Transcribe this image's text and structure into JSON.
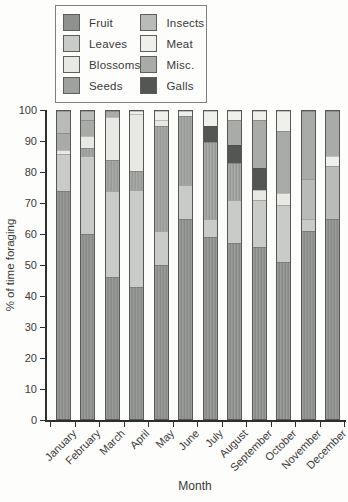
{
  "figure": {
    "y_axis_label": "% of time foraging",
    "x_axis_title": "Month",
    "y_ticks": [
      0,
      10,
      20,
      30,
      40,
      50,
      60,
      70,
      80,
      90,
      100
    ]
  },
  "legend": {
    "entries": [
      {
        "label": "Fruit",
        "color": "#8f918e"
      },
      {
        "label": "Leaves",
        "color": "#c9cbc8"
      },
      {
        "label": "Blossoms",
        "color": "#e8e9e5"
      },
      {
        "label": "Seeds",
        "color": "#9fa19e"
      },
      {
        "label": "Insects",
        "color": "#b9bbb8"
      },
      {
        "label": "Meat",
        "color": "#eff0ec"
      },
      {
        "label": "Misc.",
        "color": "#a9aba8"
      },
      {
        "label": "Galls",
        "color": "#545653"
      }
    ]
  },
  "chart_data": {
    "type": "bar",
    "stacked": true,
    "title": "",
    "xlabel": "Month",
    "ylabel": "% of time foraging",
    "ylim": [
      0,
      100
    ],
    "grid": false,
    "legend_position": "top-left",
    "series_names": [
      "Fruit",
      "Leaves",
      "Blossoms",
      "Seeds",
      "Insects",
      "Meat",
      "Misc.",
      "Galls"
    ],
    "categories": [
      "January",
      "February",
      "March",
      "April",
      "May",
      "June",
      "July",
      "August",
      "September",
      "October",
      "November",
      "December"
    ],
    "months": [
      {
        "month": "January",
        "segments": [
          {
            "category": "Fruit",
            "value": 74
          },
          {
            "category": "Leaves",
            "value": 12
          },
          {
            "category": "Blossoms",
            "value": 1.5
          },
          {
            "category": "Misc.",
            "value": 5.5
          },
          {
            "category": "Insects",
            "value": 7
          }
        ]
      },
      {
        "month": "February",
        "segments": [
          {
            "category": "Fruit",
            "value": 60
          },
          {
            "category": "Leaves",
            "value": 25.5
          },
          {
            "category": "Seeds",
            "value": 2.5
          },
          {
            "category": "Blossoms",
            "value": 4
          },
          {
            "category": "Misc.",
            "value": 5
          },
          {
            "category": "Insects",
            "value": 3
          }
        ]
      },
      {
        "month": "March",
        "segments": [
          {
            "category": "Fruit",
            "value": 46
          },
          {
            "category": "Leaves",
            "value": 28
          },
          {
            "category": "Seeds",
            "value": 10
          },
          {
            "category": "Blossoms",
            "value": 14
          },
          {
            "category": "Misc.",
            "value": 2
          }
        ]
      },
      {
        "month": "April",
        "segments": [
          {
            "category": "Fruit",
            "value": 43
          },
          {
            "category": "Leaves",
            "value": 31.5
          },
          {
            "category": "Seeds",
            "value": 6
          },
          {
            "category": "Blossoms",
            "value": 18.5
          },
          {
            "category": "Meat",
            "value": 1
          }
        ]
      },
      {
        "month": "May",
        "segments": [
          {
            "category": "Fruit",
            "value": 50
          },
          {
            "category": "Leaves",
            "value": 11
          },
          {
            "category": "Seeds",
            "value": 34
          },
          {
            "category": "Blossoms",
            "value": 2
          },
          {
            "category": "Meat",
            "value": 3
          }
        ]
      },
      {
        "month": "June",
        "segments": [
          {
            "category": "Fruit",
            "value": 65
          },
          {
            "category": "Leaves",
            "value": 11
          },
          {
            "category": "Seeds",
            "value": 22.5
          },
          {
            "category": "Meat",
            "value": 1.5
          }
        ]
      },
      {
        "month": "July",
        "segments": [
          {
            "category": "Fruit",
            "value": 59
          },
          {
            "category": "Leaves",
            "value": 6
          },
          {
            "category": "Seeds",
            "value": 25
          },
          {
            "category": "Galls",
            "value": 5
          },
          {
            "category": "Meat",
            "value": 5
          }
        ]
      },
      {
        "month": "August",
        "segments": [
          {
            "category": "Fruit",
            "value": 57
          },
          {
            "category": "Leaves",
            "value": 14
          },
          {
            "category": "Seeds",
            "value": 12
          },
          {
            "category": "Galls",
            "value": 6
          },
          {
            "category": "Misc.",
            "value": 8
          },
          {
            "category": "Meat",
            "value": 3
          }
        ]
      },
      {
        "month": "September",
        "segments": [
          {
            "category": "Fruit",
            "value": 56
          },
          {
            "category": "Leaves",
            "value": 15
          },
          {
            "category": "Blossoms",
            "value": 3.5
          },
          {
            "category": "Galls",
            "value": 7
          },
          {
            "category": "Misc.",
            "value": 15.5
          },
          {
            "category": "Meat",
            "value": 3
          }
        ]
      },
      {
        "month": "October",
        "segments": [
          {
            "category": "Fruit",
            "value": 51
          },
          {
            "category": "Leaves",
            "value": 18.5
          },
          {
            "category": "Blossoms",
            "value": 4
          },
          {
            "category": "Misc.",
            "value": 20
          },
          {
            "category": "Meat",
            "value": 6.5
          }
        ]
      },
      {
        "month": "November",
        "segments": [
          {
            "category": "Fruit",
            "value": 61
          },
          {
            "category": "Leaves",
            "value": 4
          },
          {
            "category": "Insects",
            "value": 13
          },
          {
            "category": "Misc.",
            "value": 22
          }
        ]
      },
      {
        "month": "December",
        "segments": [
          {
            "category": "Fruit",
            "value": 65
          },
          {
            "category": "Insects",
            "value": 17
          },
          {
            "category": "Meat",
            "value": 3.5
          },
          {
            "category": "Misc.",
            "value": 14.5
          }
        ]
      }
    ]
  }
}
